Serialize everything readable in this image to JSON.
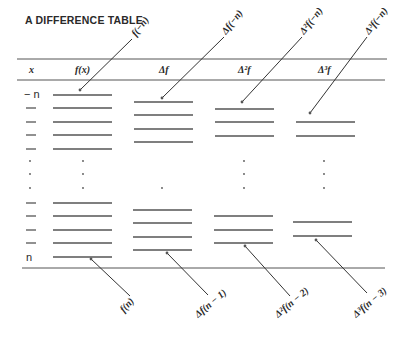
{
  "title": "A DIFFERENCE TABLE",
  "headers": {
    "x": "x",
    "fx": "f(x)",
    "d1": "Δf",
    "d2": "Δ²f",
    "d3": "Δ³f"
  },
  "row_labels": {
    "first": "− n",
    "last": "n"
  },
  "annotations_top": [
    {
      "label": "f(−n)",
      "target_column": "f(x)"
    },
    {
      "label": "Δf(−n)",
      "target_column": "Δf"
    },
    {
      "label": "Δ²f(−n)",
      "target_column": "Δ²f"
    },
    {
      "label": "Δ³f(−n)",
      "target_column": "Δ³f"
    }
  ],
  "annotations_bottom": [
    {
      "label": "f(n)",
      "target_column": "f(x)"
    },
    {
      "label": "Δf(n − 1)",
      "target_column": "Δf"
    },
    {
      "label": "Δ²f(n − 2)",
      "target_column": "Δ²f"
    },
    {
      "label": "Δ³f(n − 3)",
      "target_column": "Δ³f"
    }
  ],
  "columns": {
    "fx": {
      "top_entries": 5,
      "bottom_entries": 5
    },
    "d1": {
      "top_entries": 4,
      "bottom_entries": 4
    },
    "d2": {
      "top_entries": 3,
      "bottom_entries": 3
    },
    "d3": {
      "top_entries": 2,
      "bottom_entries": 2
    }
  },
  "ellipsis": "⋮"
}
